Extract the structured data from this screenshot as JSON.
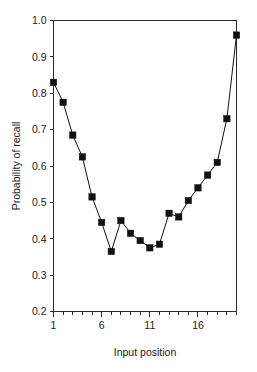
{
  "chart_data": {
    "type": "line",
    "title": "",
    "xlabel": "Input position",
    "ylabel": "Probability of recall",
    "xlim": [
      1,
      20
    ],
    "ylim": [
      0.2,
      1.0
    ],
    "grid": false,
    "legend": "none",
    "marker": "filled-square",
    "x": [
      1,
      2,
      3,
      4,
      5,
      6,
      7,
      8,
      9,
      10,
      11,
      12,
      13,
      14,
      15,
      16,
      17,
      18,
      19,
      20
    ],
    "values": [
      0.83,
      0.775,
      0.685,
      0.625,
      0.515,
      0.445,
      0.365,
      0.45,
      0.415,
      0.395,
      0.375,
      0.385,
      0.47,
      0.46,
      0.505,
      0.54,
      0.575,
      0.61,
      0.73,
      0.96
    ],
    "xticks_major": [
      1,
      6,
      11,
      16
    ],
    "xtick_labels": [
      "1",
      "6",
      "11",
      "16"
    ],
    "yticks": [
      0.2,
      0.3,
      0.4,
      0.5,
      0.6,
      0.7,
      0.8,
      0.9,
      1.0
    ],
    "ytick_labels": [
      "0.2",
      "0.3",
      "0.4",
      "0.5",
      "0.6",
      "0.7",
      "0.8",
      "0.9",
      "1.0"
    ],
    "colors": {
      "line": "#111111",
      "marker": "#111111",
      "axis": "#2b2b2b",
      "background": "#ffffff"
    }
  }
}
